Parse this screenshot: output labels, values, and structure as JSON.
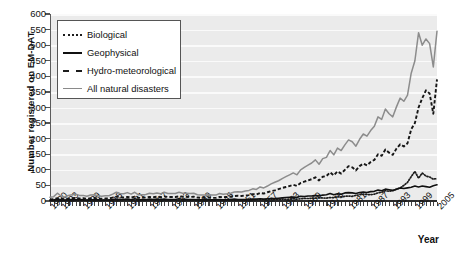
{
  "chart_data": {
    "type": "line",
    "title": "",
    "xlabel": "Year",
    "ylabel": "Number registered on EM-DAT",
    "ylim": [
      0,
      600
    ],
    "ytick_labels": [
      "0",
      "50",
      "100",
      "150",
      "200",
      "250",
      "300",
      "350",
      "400",
      "450",
      "500",
      "550",
      "600"
    ],
    "ytick_values": [
      0,
      50,
      100,
      150,
      200,
      250,
      300,
      350,
      400,
      450,
      500,
      550,
      600
    ],
    "xlim": [
      1900,
      2005
    ],
    "xtick_labels": [
      "1900",
      "1903",
      "1909",
      "1915",
      "1921",
      "1927",
      "1933",
      "1939",
      "1945",
      "1951",
      "1957",
      "1963",
      "1969",
      "1975",
      "1981",
      "1987",
      "1993",
      "1999",
      "2005"
    ],
    "xtick_values": [
      1900,
      1903,
      1909,
      1915,
      1921,
      1927,
      1933,
      1939,
      1945,
      1951,
      1957,
      1963,
      1969,
      1975,
      1981,
      1987,
      1993,
      1999,
      2005
    ],
    "grid": "horizontal-white",
    "legend_position": "upper-left-inside",
    "x": [
      1900,
      1901,
      1902,
      1903,
      1904,
      1905,
      1906,
      1907,
      1908,
      1909,
      1910,
      1911,
      1912,
      1913,
      1914,
      1915,
      1916,
      1917,
      1918,
      1919,
      1920,
      1921,
      1922,
      1923,
      1924,
      1925,
      1926,
      1927,
      1928,
      1929,
      1930,
      1931,
      1932,
      1933,
      1934,
      1935,
      1936,
      1937,
      1938,
      1939,
      1940,
      1941,
      1942,
      1943,
      1944,
      1945,
      1946,
      1947,
      1948,
      1949,
      1950,
      1951,
      1952,
      1953,
      1954,
      1955,
      1956,
      1957,
      1958,
      1959,
      1960,
      1961,
      1962,
      1963,
      1964,
      1965,
      1966,
      1967,
      1968,
      1969,
      1970,
      1971,
      1972,
      1973,
      1974,
      1975,
      1976,
      1977,
      1978,
      1979,
      1980,
      1981,
      1982,
      1983,
      1984,
      1985,
      1986,
      1987,
      1988,
      1989,
      1990,
      1991,
      1992,
      1993,
      1994,
      1995,
      1996,
      1997,
      1998,
      1999,
      2000,
      2001,
      2002,
      2003,
      2004,
      2005
    ],
    "series": [
      {
        "name": "Biological",
        "style": "dotted",
        "color": "#1c1c1c",
        "values": [
          2,
          2,
          3,
          2,
          2,
          3,
          3,
          4,
          3,
          3,
          2,
          3,
          3,
          2,
          2,
          3,
          3,
          4,
          6,
          5,
          4,
          5,
          4,
          3,
          3,
          3,
          3,
          3,
          3,
          3,
          3,
          4,
          3,
          3,
          3,
          3,
          3,
          3,
          3,
          3,
          2,
          2,
          2,
          2,
          2,
          2,
          3,
          3,
          3,
          3,
          3,
          3,
          3,
          3,
          3,
          3,
          3,
          4,
          4,
          4,
          4,
          5,
          5,
          6,
          5,
          6,
          7,
          6,
          7,
          8,
          8,
          9,
          9,
          10,
          10,
          9,
          11,
          11,
          13,
          13,
          15,
          16,
          15,
          18,
          20,
          22,
          21,
          20,
          22,
          26,
          28,
          33,
          31,
          33,
          38,
          42,
          50,
          60,
          78,
          95,
          73,
          90,
          80,
          77,
          70,
          72
        ]
      },
      {
        "name": "Geophysical",
        "style": "solid",
        "color": "#101010",
        "values": [
          3,
          3,
          6,
          4,
          3,
          4,
          5,
          4,
          5,
          4,
          3,
          4,
          4,
          4,
          3,
          3,
          3,
          4,
          5,
          4,
          5,
          6,
          4,
          7,
          4,
          4,
          4,
          6,
          5,
          6,
          5,
          6,
          5,
          5,
          5,
          7,
          5,
          5,
          5,
          5,
          4,
          4,
          4,
          4,
          4,
          4,
          5,
          4,
          4,
          5,
          6,
          5,
          5,
          5,
          5,
          6,
          6,
          7,
          6,
          7,
          8,
          8,
          9,
          10,
          11,
          12,
          13,
          12,
          15,
          14,
          16,
          16,
          18,
          16,
          19,
          20,
          24,
          20,
          23,
          22,
          26,
          27,
          26,
          24,
          27,
          29,
          27,
          30,
          31,
          35,
          33,
          38,
          36,
          34,
          38,
          42,
          40,
          42,
          44,
          48,
          45,
          48,
          46,
          44,
          49,
          52
        ]
      },
      {
        "name": "Hydro-meteorological",
        "style": "dashed",
        "color": "#161616",
        "values": [
          5,
          6,
          9,
          7,
          6,
          8,
          9,
          10,
          8,
          9,
          7,
          9,
          10,
          8,
          7,
          8,
          8,
          11,
          14,
          12,
          11,
          13,
          11,
          14,
          10,
          10,
          11,
          13,
          12,
          14,
          12,
          15,
          13,
          13,
          13,
          15,
          14,
          14,
          13,
          14,
          11,
          10,
          10,
          11,
          10,
          10,
          13,
          12,
          13,
          14,
          16,
          17,
          16,
          18,
          19,
          22,
          21,
          26,
          24,
          28,
          32,
          34,
          38,
          42,
          45,
          48,
          52,
          48,
          58,
          62,
          66,
          70,
          76,
          66,
          78,
          80,
          92,
          82,
          95,
          88,
          100,
          112,
          108,
          98,
          112,
          120,
          114,
          125,
          132,
          150,
          145,
          165,
          155,
          148,
          168,
          182,
          175,
          185,
          230,
          250,
          300,
          330,
          355,
          345,
          280,
          390
        ]
      },
      {
        "name": "All natural disasters",
        "style": "solid",
        "color": "#8c8c8c",
        "values": [
          12,
          14,
          25,
          16,
          13,
          18,
          20,
          22,
          18,
          18,
          15,
          19,
          20,
          17,
          15,
          17,
          17,
          22,
          28,
          24,
          23,
          27,
          22,
          28,
          20,
          20,
          21,
          25,
          23,
          26,
          23,
          28,
          24,
          24,
          24,
          28,
          25,
          25,
          24,
          25,
          20,
          19,
          19,
          20,
          19,
          19,
          24,
          22,
          23,
          25,
          29,
          30,
          29,
          32,
          34,
          39,
          37,
          45,
          42,
          48,
          55,
          60,
          65,
          72,
          78,
          84,
          90,
          84,
          100,
          108,
          115,
          122,
          132,
          118,
          136,
          140,
          162,
          148,
          170,
          162,
          180,
          196,
          190,
          176,
          198,
          215,
          208,
          226,
          240,
          270,
          262,
          295,
          280,
          270,
          302,
          330,
          320,
          340,
          410,
          450,
          540,
          500,
          520,
          505,
          430,
          545
        ]
      }
    ]
  }
}
